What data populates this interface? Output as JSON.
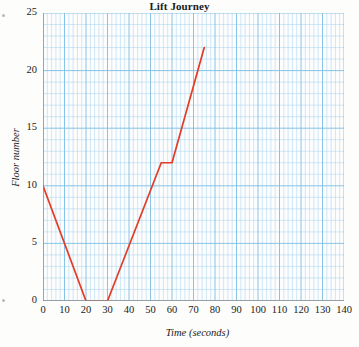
{
  "chart_data": {
    "type": "line",
    "title": "Lift Journey",
    "xlabel": "Time (seconds)",
    "ylabel": "Floor number",
    "xlim": [
      0,
      140
    ],
    "ylim": [
      0,
      25
    ],
    "xticks": [
      0,
      10,
      20,
      30,
      40,
      50,
      60,
      70,
      80,
      90,
      100,
      110,
      120,
      130,
      140
    ],
    "yticks": [
      0,
      5,
      10,
      15,
      20,
      25
    ],
    "x_minor_step": 2,
    "y_minor_step": 1,
    "grid": true,
    "legend": "none",
    "series": [
      {
        "name": "Lift position",
        "color": "#e23b26",
        "points": [
          {
            "x": 0,
            "y": 10
          },
          {
            "x": 20,
            "y": 0
          },
          {
            "x": 30,
            "y": 0
          },
          {
            "x": 55,
            "y": 12
          },
          {
            "x": 60,
            "y": 12
          },
          {
            "x": 75,
            "y": 22
          }
        ]
      }
    ]
  },
  "style": {
    "grid_minor_color": "#a8d4ee",
    "grid_major_color": "#7cbde4",
    "axis_color": "#8a8a8a",
    "line_color": "#e23b26",
    "plot_background": "#fdfdfd",
    "page_background": "#fdfdfb"
  }
}
